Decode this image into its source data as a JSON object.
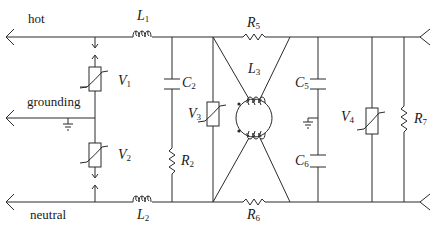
{
  "diagram": {
    "type": "circuit-schematic",
    "title": "",
    "lines": {
      "hot": "hot",
      "grounding": "grounding",
      "neutral": "neutral"
    },
    "components": {
      "L1": {
        "letter": "L",
        "sub": "1",
        "kind": "inductor"
      },
      "L2": {
        "letter": "L",
        "sub": "2",
        "kind": "inductor"
      },
      "L3": {
        "letter": "L",
        "sub": "3",
        "kind": "common-mode choke"
      },
      "C2": {
        "letter": "C",
        "sub": "2",
        "kind": "capacitor"
      },
      "C5": {
        "letter": "C",
        "sub": "5",
        "kind": "capacitor"
      },
      "C6": {
        "letter": "C",
        "sub": "6",
        "kind": "capacitor"
      },
      "R2": {
        "letter": "R",
        "sub": "2",
        "kind": "resistor"
      },
      "R5": {
        "letter": "R",
        "sub": "5",
        "kind": "resistor"
      },
      "R6": {
        "letter": "R",
        "sub": "6",
        "kind": "resistor"
      },
      "R7": {
        "letter": "R",
        "sub": "7",
        "kind": "resistor"
      },
      "V1": {
        "letter": "V",
        "sub": "1",
        "kind": "varistor"
      },
      "V2": {
        "letter": "V",
        "sub": "2",
        "kind": "varistor"
      },
      "V3": {
        "letter": "V",
        "sub": "3",
        "kind": "varistor"
      },
      "V4": {
        "letter": "V",
        "sub": "4",
        "kind": "varistor"
      }
    },
    "colors": {
      "line": "#2a2a2a",
      "background": "#ffffff"
    }
  }
}
